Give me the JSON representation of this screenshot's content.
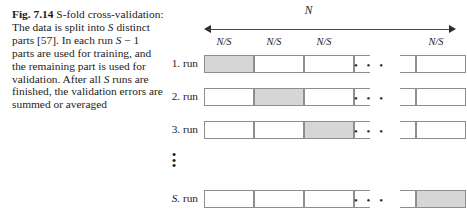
{
  "caption": {
    "figure_label": "Fig. 7.14",
    "line_1_rest": "S-fold",
    "body": "cross-validation: The data is split into S distinct parts [57]. In each run S − 1 parts are used for training, and the remaining part is used for validation. After all S runs are finished, the validation errors are summed or averaged",
    "segments": [
      {
        "text": "cross-validation: The data is split into ",
        "italic": false
      },
      {
        "text": "S",
        "italic": true
      },
      {
        "text": " distinct parts [57]. In each run ",
        "italic": false
      },
      {
        "text": "S",
        "italic": true
      },
      {
        "text": " − 1 parts are used for training, and the remaining part is used for validation. After all ",
        "italic": false
      },
      {
        "text": "S",
        "italic": true
      },
      {
        "text": " runs are finished, the validation errors are summed or averaged",
        "italic": false
      }
    ]
  },
  "diagram": {
    "total_label": "N",
    "part_label": "N/S",
    "part_labels": [
      "N/S",
      "N/S",
      "N/S",
      "N/S"
    ],
    "horizontal_ellipsis": "• • •",
    "vertical_ellipsis": [
      "•",
      "•",
      "•"
    ],
    "rows": [
      {
        "label": "1. run",
        "label_prefix": "1.",
        "label_suffix": "run",
        "shaded_index": 0
      },
      {
        "label": "2. run",
        "label_prefix": "2.",
        "label_suffix": "run",
        "shaded_index": 1
      },
      {
        "label": "3. run",
        "label_prefix": "3.",
        "label_suffix": "run",
        "shaded_index": 2
      },
      {
        "label": "S. run",
        "label_prefix": "S.",
        "label_suffix": "run",
        "shaded_index": 4
      }
    ],
    "cells_per_row": 5,
    "colors": {
      "shaded_cell": "#d6d6d6",
      "cell_border": "#8e8e8e",
      "arrow": "#2b2b2b",
      "text": "#1c1c1c"
    }
  }
}
